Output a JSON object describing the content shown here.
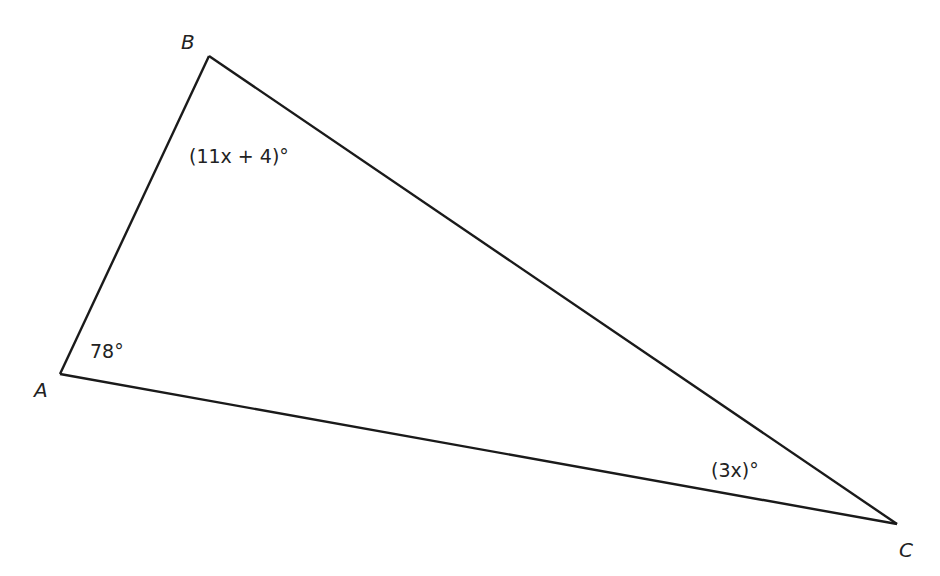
{
  "figure": {
    "type": "triangle",
    "vertices": [
      {
        "id": "A",
        "label": "A"
      },
      {
        "id": "B",
        "label": "B"
      },
      {
        "id": "C",
        "label": "C"
      }
    ],
    "angles": [
      {
        "vertex": "A",
        "label": "78°"
      },
      {
        "vertex": "B",
        "label": "(11x + 4)°"
      },
      {
        "vertex": "C",
        "label": "(3x)°"
      }
    ],
    "colors": {
      "stroke": "#1a1a1a",
      "text": "#222222"
    }
  }
}
